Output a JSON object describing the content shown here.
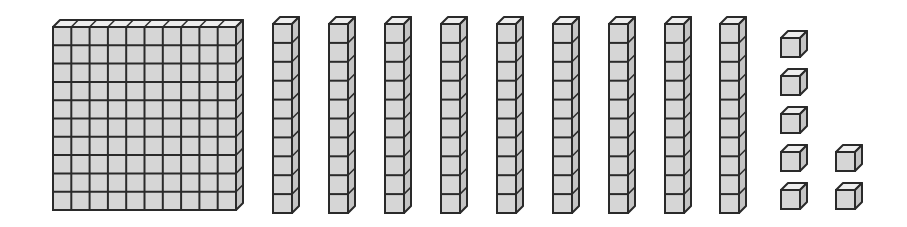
{
  "diagram": {
    "colors": {
      "face": "#d6d6d6",
      "side": "#c4c4c4",
      "top": "#eeeeee",
      "stroke": "#2a2a2a"
    },
    "hundreds": {
      "count": 1,
      "grid": 10,
      "x": 53,
      "y": 27,
      "cell": 18.3
    },
    "tens": {
      "count": 9,
      "xs": [
        273,
        329,
        385,
        441,
        497,
        553,
        609,
        665,
        720
      ],
      "y": 24,
      "cell": 18.9,
      "width": 19
    },
    "ones": {
      "count": 7,
      "cubes": [
        {
          "x": 781,
          "y": 38
        },
        {
          "x": 781,
          "y": 76
        },
        {
          "x": 781,
          "y": 114
        },
        {
          "x": 781,
          "y": 152
        },
        {
          "x": 781,
          "y": 190
        },
        {
          "x": 836,
          "y": 152
        },
        {
          "x": 836,
          "y": 190
        }
      ],
      "size": 19
    },
    "total_value": 197
  }
}
